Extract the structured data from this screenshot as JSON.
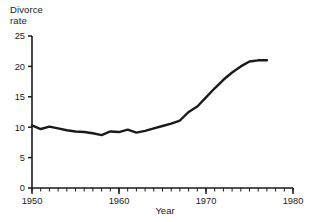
{
  "chart_data": {
    "type": "line",
    "title": "",
    "ylabel": "Divorce\nrate",
    "ylabel_line1": "Divorce",
    "ylabel_line2": "rate",
    "xlabel": "Year",
    "xlim": [
      1950,
      1980
    ],
    "ylim": [
      0,
      25
    ],
    "grid": false,
    "legend": null,
    "x_major_ticks": [
      1950,
      1960,
      1970,
      1980
    ],
    "x_major_tick_labels": [
      "1950",
      "1960",
      "1970",
      "1980"
    ],
    "x_minor_tick_step": 1,
    "y_ticks": [
      0,
      5,
      10,
      15,
      20,
      25
    ],
    "y_tick_labels": [
      "0",
      "5",
      "10",
      "15",
      "20",
      "25"
    ],
    "line_color": "#1a1a1a",
    "line_width_px": 2.4,
    "x": [
      1950,
      1951,
      1952,
      1953,
      1954,
      1955,
      1956,
      1957,
      1958,
      1959,
      1960,
      1961,
      1962,
      1963,
      1964,
      1965,
      1966,
      1967,
      1968,
      1969,
      1970,
      1971,
      1972,
      1973,
      1974,
      1975,
      1976,
      1977
    ],
    "values": [
      10.3,
      9.7,
      10.1,
      9.8,
      9.5,
      9.3,
      9.2,
      9.0,
      8.7,
      9.3,
      9.2,
      9.6,
      9.1,
      9.4,
      9.8,
      10.2,
      10.6,
      11.1,
      12.5,
      13.4,
      14.9,
      16.4,
      17.8,
      19.0,
      20.0,
      20.8,
      21.0,
      21.0
    ],
    "series": [
      {
        "name": "Divorce rate",
        "values": [
          10.3,
          9.7,
          10.1,
          9.8,
          9.5,
          9.3,
          9.2,
          9.0,
          8.7,
          9.3,
          9.2,
          9.6,
          9.1,
          9.4,
          9.8,
          10.2,
          10.6,
          11.1,
          12.5,
          13.4,
          14.9,
          16.4,
          17.8,
          19.0,
          20.0,
          20.8,
          21.0,
          21.0
        ]
      }
    ]
  },
  "axes": {
    "y_label_line1": "Divorce",
    "y_label_line2": "rate",
    "x_title": "Year"
  }
}
